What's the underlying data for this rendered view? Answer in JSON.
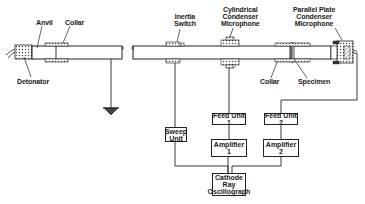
{
  "diagram": {
    "colors": {
      "line": "#222222",
      "background": "#ffffff",
      "hatch": "#444444"
    },
    "labels": {
      "anvil": "Anvil",
      "collar_left": "Collar",
      "detonator": "Detonator",
      "inertia_switch_line1": "Inertia",
      "inertia_switch_line2": "Switch",
      "cyl_mic_line1": "Cylindrical",
      "cyl_mic_line2": "Condenser",
      "cyl_mic_line3": "Microphone",
      "pp_mic_line1": "Parallel Plate",
      "pp_mic_line2": "Condenser",
      "pp_mic_line3": "Microphone",
      "collar_right": "Collar",
      "specimen": "Specimen"
    },
    "boxes": {
      "sweep_unit_line1": "Sweep",
      "sweep_unit_line2": "Unit",
      "feed_unit_1": "Feed Unit 1",
      "amplifier_1": "Amplifier 1",
      "feed_unit_2": "Feed Unit 2",
      "amplifier_2": "Amplifier 2",
      "cro_line1": "Cathode",
      "cro_line2": "Ray",
      "cro_line3": "Oscillograph"
    },
    "symbols": {
      "ground": "ground-symbol"
    }
  }
}
